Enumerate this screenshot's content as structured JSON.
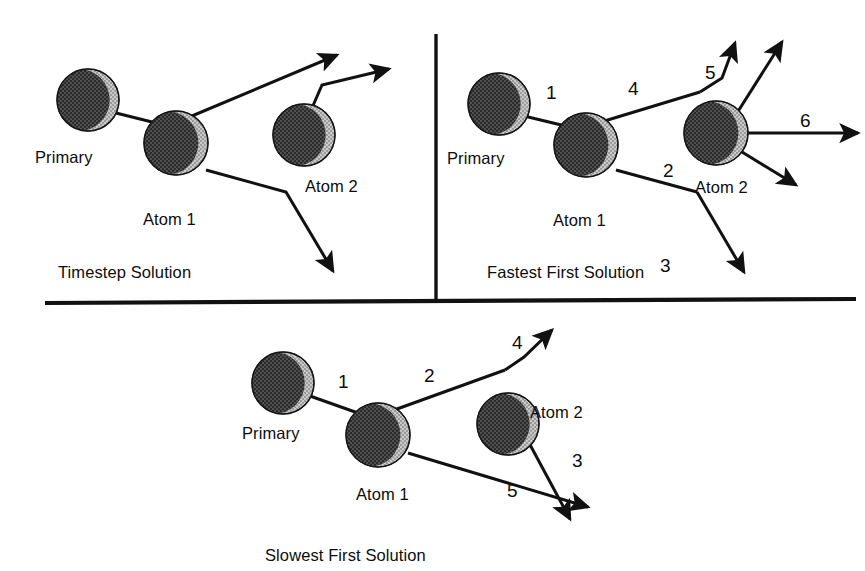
{
  "figure": {
    "background_color": "#ffffff",
    "ink_color": "#111111",
    "sphere_dark_color": "#3a3a3a",
    "sphere_light_color": "#b5b5b5"
  },
  "panels": [
    {
      "id": "timestep",
      "caption": "Timestep Solution",
      "caption_pos": {
        "x": 58,
        "y": 263
      },
      "atoms": [
        {
          "name": "primary",
          "label": "Primary",
          "cx": 88,
          "cy": 100,
          "r": 31,
          "label_x": 35,
          "label_y": 148
        },
        {
          "name": "atom-1",
          "label": "Atom 1",
          "cx": 176,
          "cy": 143,
          "r": 32,
          "label_x": 143,
          "label_y": 210
        },
        {
          "name": "atom-2",
          "label": "Atom 2",
          "cx": 304,
          "cy": 135,
          "r": 31,
          "label_x": 305,
          "label_y": 177
        }
      ],
      "segments": [
        {
          "name": "primary-to-atom1",
          "label": "",
          "label_x": 0,
          "label_y": 0,
          "points": "112,112 168,126",
          "arrow": false
        },
        {
          "name": "atom1-recoil-up",
          "label": "",
          "label_x": 0,
          "label_y": 0,
          "points": "168,126 337,55",
          "arrow": true
        },
        {
          "name": "atom2-recoil-up",
          "label": "",
          "label_x": 0,
          "label_y": 0,
          "points": "312,108 322,85 389,69",
          "arrow": true
        },
        {
          "name": "atom1-recoil-down",
          "label": "",
          "label_x": 0,
          "label_y": 0,
          "points": "206,170 286,192 333,271",
          "arrow": true
        }
      ]
    },
    {
      "id": "fastest-first",
      "caption": "Fastest First Solution",
      "caption_pos": {
        "x": 487,
        "y": 263
      },
      "atoms": [
        {
          "name": "primary",
          "label": "Primary",
          "cx": 499,
          "cy": 104,
          "r": 31,
          "label_x": 447,
          "label_y": 149
        },
        {
          "name": "atom-1",
          "label": "Atom 1",
          "cx": 586,
          "cy": 145,
          "r": 32,
          "label_x": 553,
          "label_y": 211
        },
        {
          "name": "atom-2",
          "label": "Atom 2",
          "cx": 716,
          "cy": 133,
          "r": 32,
          "label_x": 695,
          "label_y": 178
        }
      ],
      "segments": [
        {
          "name": "segment-1",
          "label": "1",
          "label_x": 546,
          "label_y": 82,
          "points": "524,116 578,129",
          "arrow": false
        },
        {
          "name": "segment-4",
          "label": "4",
          "label_x": 628,
          "label_y": 78,
          "points": "578,129 700,92",
          "arrow": false
        },
        {
          "name": "segment-5",
          "label": "5",
          "label_x": 705,
          "label_y": 62,
          "points": "700,92 722,78 735,43",
          "arrow": true
        },
        {
          "name": "segment-2",
          "label": "2",
          "label_x": 663,
          "label_y": 160,
          "points": "616,170 697,192",
          "arrow": false
        },
        {
          "name": "segment-3",
          "label": "3",
          "label_x": 660,
          "label_y": 255,
          "points": "697,192 744,272",
          "arrow": true
        },
        {
          "name": "segment-atom2-up",
          "label": "",
          "label_x": 0,
          "label_y": 0,
          "points": "737,113 782,42",
          "arrow": true
        },
        {
          "name": "segment-6",
          "label": "6",
          "label_x": 800,
          "label_y": 110,
          "points": "746,133 858,133",
          "arrow": true
        },
        {
          "name": "segment-atom2-down",
          "label": "",
          "label_x": 0,
          "label_y": 0,
          "points": "742,152 796,185",
          "arrow": true
        }
      ]
    },
    {
      "id": "slowest-first",
      "caption": "Slowest First Solution",
      "caption_pos": {
        "x": 265,
        "y": 546
      },
      "atoms": [
        {
          "name": "primary",
          "label": "Primary",
          "cx": 283,
          "cy": 383,
          "r": 31,
          "label_x": 242,
          "label_y": 424
        },
        {
          "name": "atom-1",
          "label": "Atom 1",
          "cx": 378,
          "cy": 435,
          "r": 32,
          "label_x": 356,
          "label_y": 485
        },
        {
          "name": "atom-2",
          "label": "Atom 2",
          "cx": 508,
          "cy": 424,
          "r": 31,
          "label_x": 530,
          "label_y": 403
        }
      ],
      "segments": [
        {
          "name": "segment-1",
          "label": "1",
          "label_x": 338,
          "label_y": 371,
          "points": "310,396 372,418",
          "arrow": false
        },
        {
          "name": "segment-2",
          "label": "2",
          "label_x": 424,
          "label_y": 365,
          "points": "372,418 505,370",
          "arrow": false
        },
        {
          "name": "segment-4",
          "label": "4",
          "label_x": 512,
          "label_y": 332,
          "points": "505,370 524,357 552,330",
          "arrow": true
        },
        {
          "name": "segment-5",
          "label": "5",
          "label_x": 507,
          "label_y": 480,
          "points": "408,453 588,507",
          "arrow": true
        },
        {
          "name": "segment-3",
          "label": "3",
          "label_x": 572,
          "label_y": 450,
          "points": "528,441 570,519",
          "arrow": true
        }
      ]
    }
  ],
  "dividers": {
    "vertical": {
      "name": "vertical-divider",
      "x": 436,
      "y1": 34,
      "y2": 300
    },
    "horizontal": {
      "name": "horizontal-divider",
      "x1": 45,
      "y1": 303,
      "x2": 856,
      "y2": 299
    }
  }
}
